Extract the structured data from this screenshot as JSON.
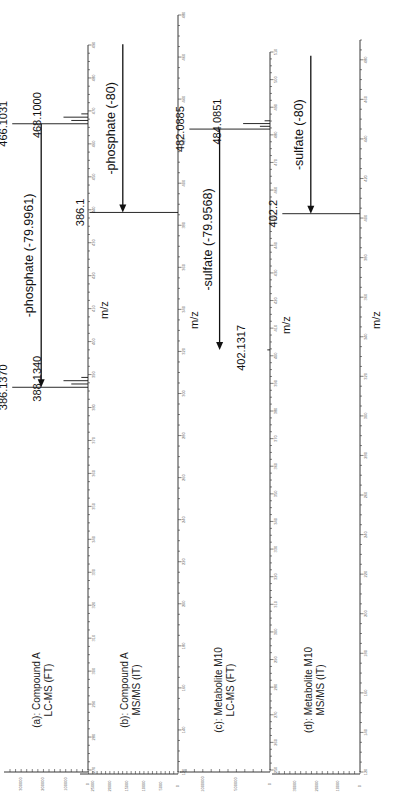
{
  "figure": {
    "orientation": "rotated-90-ccw",
    "axis_title": "m/z"
  },
  "chart_data": [
    {
      "type": "bar",
      "panel": "a",
      "title": "(a): Compound A",
      "subtitle": "LC-MS (FT)",
      "xlabel": "m/z",
      "ylabel": "",
      "xlim": [
        270,
        490
      ],
      "x_ticks": [
        270,
        280,
        290,
        300,
        310,
        320,
        330,
        340,
        350,
        360,
        370,
        380,
        390,
        400,
        410,
        420,
        430,
        440,
        450,
        460,
        470,
        480,
        490
      ],
      "ylim": [
        0,
        350000
      ],
      "y_ticks": [
        0,
        100000,
        200000,
        300000
      ],
      "peaks": [
        {
          "mz": 386.137,
          "intensity": 340000,
          "label": "386.1370"
        },
        {
          "mz": 387.14,
          "intensity": 75000,
          "label": ""
        },
        {
          "mz": 388.134,
          "intensity": 110000,
          "label": "388.1340"
        },
        {
          "mz": 389.13,
          "intensity": 30000,
          "label": ""
        },
        {
          "mz": 466.1031,
          "intensity": 340000,
          "label": "466.1031"
        },
        {
          "mz": 467.1,
          "intensity": 75000,
          "label": ""
        },
        {
          "mz": 468.1,
          "intensity": 110000,
          "label": "468.1000"
        },
        {
          "mz": 469.1,
          "intensity": 30000,
          "label": ""
        }
      ],
      "annotations": [
        {
          "text": "-phosphate (-79.9961)",
          "from_mz": 466.1031,
          "to_mz": 386.137
        }
      ]
    },
    {
      "type": "bar",
      "panel": "b",
      "title": "(b): Compound A",
      "subtitle": "MS/MS (IT)",
      "xlabel": "m/z",
      "ylabel": "",
      "xlim": [
        120,
        480
      ],
      "x_ticks": [
        120,
        140,
        160,
        180,
        200,
        220,
        240,
        260,
        280,
        300,
        320,
        340,
        360,
        380,
        400,
        420,
        440,
        460,
        480
      ],
      "ylim": [
        0,
        27000
      ],
      "y_ticks": [
        0,
        5000,
        10000,
        15000,
        20000,
        25000
      ],
      "peaks": [
        {
          "mz": 386.1,
          "intensity": 26000,
          "label": "386.1"
        }
      ],
      "annotations": [
        {
          "text": "-phosphate (-80)",
          "from_mz": 466.1,
          "to_mz": 386.1
        }
      ]
    },
    {
      "type": "bar",
      "panel": "c",
      "title": "(c): Metabolite M10",
      "subtitle": "LC-MS (FT)",
      "xlabel": "m/z",
      "ylabel": "",
      "xlim": [
        250,
        510
      ],
      "x_ticks": [
        250,
        260,
        270,
        280,
        290,
        300,
        310,
        320,
        330,
        340,
        350,
        360,
        370,
        380,
        390,
        400,
        410,
        420,
        430,
        440,
        450,
        460,
        470,
        480,
        490,
        500,
        510
      ],
      "ylim": [
        0,
        1250000
      ],
      "y_ticks": [
        0,
        500000,
        1000000
      ],
      "peaks": [
        {
          "mz": 402.1317,
          "intensity": 40000,
          "label": "402.1317"
        },
        {
          "mz": 482.0885,
          "intensity": 1200000,
          "label": "482.0885"
        },
        {
          "mz": 483.09,
          "intensity": 150000,
          "label": ""
        },
        {
          "mz": 484.0851,
          "intensity": 400000,
          "label": "484.0851"
        },
        {
          "mz": 485.09,
          "intensity": 80000,
          "label": ""
        }
      ],
      "annotations": [
        {
          "text": "-sulfate (-79.9568)",
          "from_mz": 482.0885,
          "to_mz": 402.1317
        }
      ]
    },
    {
      "type": "bar",
      "panel": "d",
      "title": "(d): Metabolite M10",
      "subtitle": "MS/MS (IT)",
      "xlabel": "m/z",
      "ylabel": "",
      "xlim": [
        120,
        490
      ],
      "x_ticks": [
        120,
        140,
        160,
        180,
        200,
        220,
        240,
        260,
        280,
        300,
        320,
        340,
        360,
        380,
        400,
        420,
        440,
        460,
        480
      ],
      "ylim": [
        0,
        38000
      ],
      "y_ticks": [
        0,
        10000,
        20000,
        30000
      ],
      "peaks": [
        {
          "mz": 402.2,
          "intensity": 36000,
          "label": "402.2"
        }
      ],
      "annotations": [
        {
          "text": "-sulfate (-80)",
          "from_mz": 482.1,
          "to_mz": 402.2
        }
      ]
    }
  ]
}
